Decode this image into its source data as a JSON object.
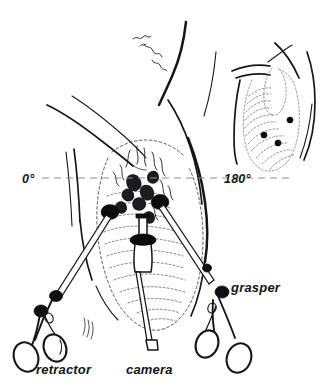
{
  "figure": {
    "title": "Laparoscopic port placement and instrument orientation",
    "background_color": "#ffffff",
    "ink_color": "#16161a"
  },
  "angle_markers": {
    "left": {
      "label": "0°",
      "position": "left of torso, on reference axis"
    },
    "right": {
      "label": "180°",
      "position": "right of torso, on reference axis"
    },
    "reference_axis": {
      "name": "horizontal dashed reference line",
      "style": "dashed",
      "color": "#8d8d96"
    }
  },
  "instruments": [
    {
      "id": "retractor",
      "label": "retractor",
      "side": "left",
      "handle_type": "ring-handle",
      "entry_port": "left lateral trocar"
    },
    {
      "id": "camera",
      "label": "camera",
      "side": "center",
      "handle_type": "straight-shaft-laparoscope",
      "entry_port": "central trocar"
    },
    {
      "id": "grasper",
      "label": "grasper",
      "side": "right",
      "handle_type": "ring-handle",
      "entry_port": "right lateral trocar"
    }
  ],
  "port_sites": {
    "main_view_count": 3,
    "inset_view_count": 3,
    "marker_color": "#0b0b0e",
    "marker_shape": "filled-dot"
  },
  "inset": {
    "name": "lateral rib cage view",
    "orientation": "180° side view",
    "contents": "rib cage with three port site dots"
  }
}
